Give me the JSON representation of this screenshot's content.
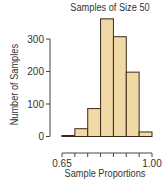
{
  "chart_data": {
    "type": "bar",
    "title": "Samples of Size 50",
    "xlabel": "Sample Proportions",
    "ylabel": "Number of Samples",
    "bins": [
      {
        "start": 0.65,
        "end": 0.7,
        "value": 3
      },
      {
        "start": 0.7,
        "end": 0.75,
        "value": 24
      },
      {
        "start": 0.75,
        "end": 0.8,
        "value": 86
      },
      {
        "start": 0.8,
        "end": 0.85,
        "value": 362
      },
      {
        "start": 0.85,
        "end": 0.9,
        "value": 307
      },
      {
        "start": 0.9,
        "end": 0.95,
        "value": 198
      },
      {
        "start": 0.95,
        "end": 1.0,
        "value": 14
      }
    ],
    "categories": [
      "0.65-0.70",
      "0.70-0.75",
      "0.75-0.80",
      "0.80-0.85",
      "0.85-0.90",
      "0.90-0.95",
      "0.95-1.00"
    ],
    "values": [
      3,
      24,
      86,
      362,
      307,
      198,
      14
    ],
    "y_ticks": [
      0,
      100,
      200,
      300
    ],
    "x_tick_labels": [
      "0.65",
      "1.00"
    ],
    "x_ticks": [
      0.65,
      0.7,
      0.75,
      0.8,
      0.85,
      0.9,
      0.95,
      1.0
    ],
    "ylim": [
      0,
      370
    ],
    "xlim": [
      0.65,
      1.0
    ],
    "grid": false,
    "legend": null,
    "bar_color": "#f0d9a4",
    "bar_edge_color": "#3a2a1a"
  }
}
